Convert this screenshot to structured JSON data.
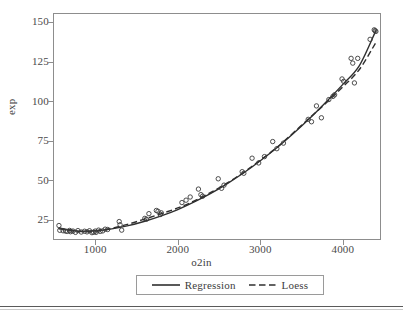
{
  "chart_data": {
    "type": "scatter",
    "title": "",
    "xlabel": "o2in",
    "ylabel": "exp",
    "xlim": [
      500,
      4450
    ],
    "ylim": [
      13,
      155
    ],
    "grid": false,
    "legend_position": "bottom",
    "x_ticks": [
      1000,
      2000,
      3000,
      4000
    ],
    "y_ticks": [
      25,
      50,
      75,
      100,
      125,
      150
    ],
    "x_tick_labels": [
      "1000",
      "2000",
      "3000",
      "4000"
    ],
    "y_tick_labels": [
      "25",
      "50",
      "75",
      "100",
      "125",
      "150"
    ],
    "marker": "open-circle",
    "points": [
      {
        "x": 560,
        "y": 21.5
      },
      {
        "x": 570,
        "y": 18.5
      },
      {
        "x": 610,
        "y": 18.2
      },
      {
        "x": 640,
        "y": 18.0
      },
      {
        "x": 660,
        "y": 17.8
      },
      {
        "x": 690,
        "y": 18.4
      },
      {
        "x": 700,
        "y": 17.6
      },
      {
        "x": 730,
        "y": 18.0
      },
      {
        "x": 760,
        "y": 17.2
      },
      {
        "x": 790,
        "y": 18.3
      },
      {
        "x": 830,
        "y": 17.4
      },
      {
        "x": 870,
        "y": 17.9
      },
      {
        "x": 900,
        "y": 17.5
      },
      {
        "x": 930,
        "y": 18.2
      },
      {
        "x": 960,
        "y": 17.0
      },
      {
        "x": 980,
        "y": 17.3
      },
      {
        "x": 1000,
        "y": 18.0
      },
      {
        "x": 1010,
        "y": 17.2
      },
      {
        "x": 1040,
        "y": 18.6
      },
      {
        "x": 1060,
        "y": 17.8
      },
      {
        "x": 1090,
        "y": 18.1
      },
      {
        "x": 1120,
        "y": 19.2
      },
      {
        "x": 1150,
        "y": 19.0
      },
      {
        "x": 1290,
        "y": 24.0
      },
      {
        "x": 1300,
        "y": 22.0
      },
      {
        "x": 1320,
        "y": 18.6
      },
      {
        "x": 1600,
        "y": 26.0
      },
      {
        "x": 1620,
        "y": 25.5
      },
      {
        "x": 1650,
        "y": 29.0
      },
      {
        "x": 1740,
        "y": 31.0
      },
      {
        "x": 1760,
        "y": 30.5
      },
      {
        "x": 1790,
        "y": 28.5
      },
      {
        "x": 1800,
        "y": 29.5
      },
      {
        "x": 2050,
        "y": 36.0
      },
      {
        "x": 2100,
        "y": 37.5
      },
      {
        "x": 2150,
        "y": 39.5
      },
      {
        "x": 2250,
        "y": 44.5
      },
      {
        "x": 2280,
        "y": 41.0
      },
      {
        "x": 2300,
        "y": 40.0
      },
      {
        "x": 2490,
        "y": 51.0
      },
      {
        "x": 2530,
        "y": 45.0
      },
      {
        "x": 2560,
        "y": 47.0
      },
      {
        "x": 2780,
        "y": 55.5
      },
      {
        "x": 2800,
        "y": 54.5
      },
      {
        "x": 2900,
        "y": 64.0
      },
      {
        "x": 2980,
        "y": 61.0
      },
      {
        "x": 3050,
        "y": 65.0
      },
      {
        "x": 3150,
        "y": 74.5
      },
      {
        "x": 3200,
        "y": 70.0
      },
      {
        "x": 3280,
        "y": 73.5
      },
      {
        "x": 3580,
        "y": 88.5
      },
      {
        "x": 3620,
        "y": 87.0
      },
      {
        "x": 3680,
        "y": 97.0
      },
      {
        "x": 3740,
        "y": 89.5
      },
      {
        "x": 3830,
        "y": 101.0
      },
      {
        "x": 3880,
        "y": 103.0
      },
      {
        "x": 3900,
        "y": 104.0
      },
      {
        "x": 3990,
        "y": 114.0
      },
      {
        "x": 4010,
        "y": 112.5
      },
      {
        "x": 4100,
        "y": 127.0
      },
      {
        "x": 4120,
        "y": 124.0
      },
      {
        "x": 4140,
        "y": 111.5
      },
      {
        "x": 4180,
        "y": 127.0
      },
      {
        "x": 4330,
        "y": 139.0
      },
      {
        "x": 4380,
        "y": 145.0
      },
      {
        "x": 4390,
        "y": 144.5
      },
      {
        "x": 4400,
        "y": 144.0
      }
    ],
    "series": [
      {
        "name": "Regression",
        "style": "solid",
        "color": "#2f2f2f",
        "x": [
          560,
          800,
          1000,
          1200,
          1400,
          1600,
          1800,
          2000,
          2200,
          2400,
          2600,
          2800,
          3000,
          3200,
          3400,
          3600,
          3800,
          4000,
          4200,
          4400
        ],
        "values": [
          19.5,
          18.0,
          18.2,
          19.4,
          21.4,
          24.2,
          27.6,
          31.6,
          36.4,
          41.8,
          48.0,
          54.8,
          62.4,
          70.6,
          79.6,
          89.2,
          99.6,
          110.6,
          122.4,
          144.5
        ]
      },
      {
        "name": "Loess",
        "style": "dashed",
        "color": "#2f2f2f",
        "x": [
          560,
          800,
          1000,
          1200,
          1400,
          1600,
          1800,
          2000,
          2200,
          2400,
          2600,
          2800,
          3000,
          3200,
          3400,
          3600,
          3800,
          4000,
          4200,
          4400
        ],
        "values": [
          20.0,
          17.8,
          18.0,
          19.8,
          22.4,
          25.6,
          29.0,
          32.6,
          37.0,
          42.4,
          48.4,
          55.2,
          62.8,
          70.8,
          80.0,
          89.6,
          99.0,
          109.0,
          120.0,
          137.0
        ]
      }
    ]
  },
  "axes": {
    "x_title": "o2in",
    "y_title": "exp"
  },
  "legend": {
    "entries": [
      {
        "label": "Regression",
        "style": "solid"
      },
      {
        "label": "Loess",
        "style": "dashed"
      }
    ]
  }
}
